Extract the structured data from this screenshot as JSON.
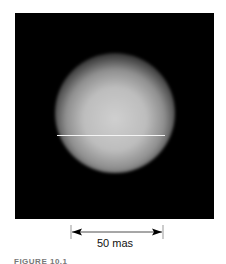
{
  "figure": {
    "image_description": "Interferometric image of a stellar disk",
    "scale_bar": {
      "label": "50 mas"
    },
    "caption": "FIGURE 10.1"
  }
}
